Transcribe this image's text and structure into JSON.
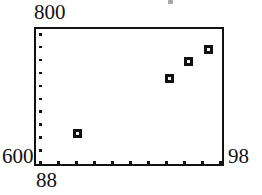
{
  "figure": {
    "name": "scatter-plot",
    "background": "#ffffff",
    "ink_color": "#111111",
    "frame": {
      "left": 34,
      "top": 27,
      "width": 190,
      "height": 139
    }
  },
  "labels": {
    "y_max": "800",
    "y_min": "600",
    "x_min": "88",
    "x_max": "98"
  },
  "chart_data": {
    "type": "scatter",
    "title": "",
    "xlabel": "",
    "ylabel": "",
    "xlim": [
      88,
      98
    ],
    "ylim": [
      600,
      800
    ],
    "grid": false,
    "legend": null,
    "x_tick_labels": [
      "88",
      "98"
    ],
    "y_tick_labels": [
      "600",
      "800"
    ],
    "x_interior_tick_count": 11,
    "y_interior_tick_count": 11,
    "marker_style": "filled-square-with-light-center",
    "points": [
      {
        "x": 90.2,
        "y": 649
      },
      {
        "x": 95.0,
        "y": 729
      },
      {
        "x": 96.0,
        "y": 753
      },
      {
        "x": 97.1,
        "y": 770
      }
    ]
  }
}
